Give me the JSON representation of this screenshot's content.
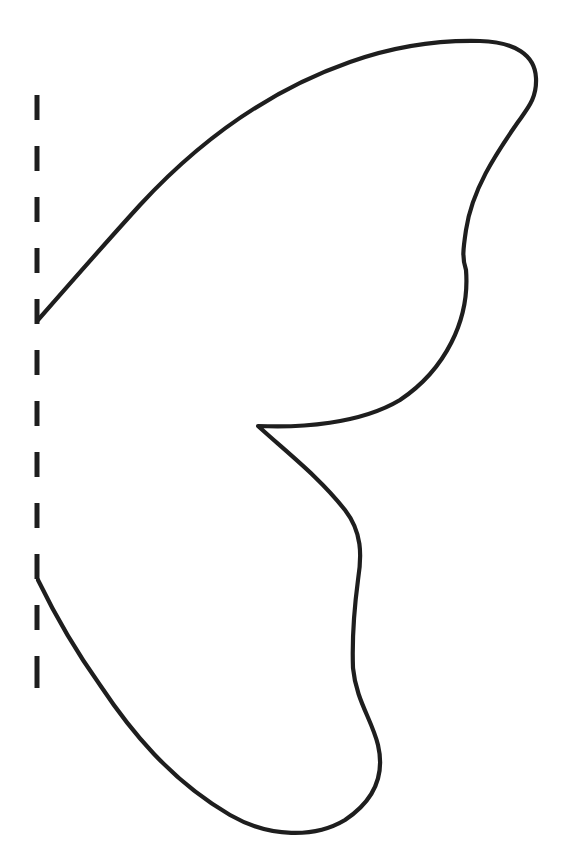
{
  "page": {
    "description": "Butterfly wing half template with dashed fold line",
    "background_color": "#ffffff",
    "stroke_color": "#1e1e1e"
  },
  "fold_line": {
    "label": "fold line",
    "x": 37,
    "dashes": [
      [
        95,
        120
      ],
      [
        146,
        171
      ],
      [
        197,
        222
      ],
      [
        248,
        273
      ],
      [
        299,
        324
      ],
      [
        350,
        375
      ],
      [
        401,
        426
      ],
      [
        452,
        477
      ],
      [
        503,
        528
      ],
      [
        554,
        579
      ],
      [
        605,
        630
      ],
      [
        656,
        688
      ]
    ]
  },
  "wing": {
    "label": "wing outline",
    "path": "M38,320 C80,272 110,238 140,205 C200,140 270,90 350,62 C395,46 440,40 480,41 C515,42 535,55 536,78 C537,98 528,108 518,122 C495,155 472,190 466,230 C463,250 462,258 466,270 C470,320 445,370 400,400 C360,424 300,428 258,426 C290,455 320,478 345,510 C362,532 362,555 358,580 C354,610 352,640 353,668 C356,700 372,720 378,745 C385,775 375,800 345,820 C315,838 270,838 230,815 C170,780 130,730 100,685 C75,650 55,615 38,580"
  }
}
